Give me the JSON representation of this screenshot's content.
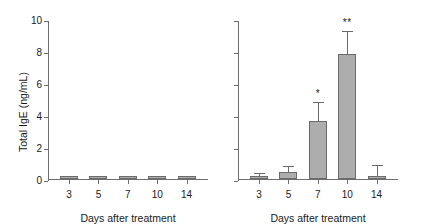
{
  "chart_data": [
    {
      "panel": "left",
      "type": "bar",
      "title": "",
      "xlabel": "Days after treatment",
      "ylabel": "Total IgE (ng/mL)",
      "categories": [
        "3",
        "5",
        "7",
        "10",
        "14"
      ],
      "values": [
        0.15,
        0.15,
        0.15,
        0.15,
        0.15
      ],
      "errors": [
        0,
        0,
        0,
        0,
        0
      ],
      "significance": [
        "",
        "",
        "",
        "",
        ""
      ],
      "ylim": [
        0,
        10
      ],
      "yticks": [
        "0",
        "2",
        "4",
        "6",
        "8",
        "10"
      ],
      "ytick_values": [
        0,
        2,
        4,
        6,
        8,
        10
      ],
      "grid": false,
      "legend": "none",
      "bar_color": "#adadad",
      "bar_edge_color": "#6b6b6b",
      "axis_color": "#6e6e6e"
    },
    {
      "panel": "right",
      "type": "bar",
      "title": "",
      "xlabel": "Days after treatment",
      "ylabel": "",
      "categories": [
        "3",
        "5",
        "7",
        "10",
        "14"
      ],
      "values": [
        0.2,
        0.45,
        3.65,
        7.8,
        0.2
      ],
      "errors": [
        0.15,
        0.35,
        1.15,
        1.45,
        0.7
      ],
      "significance": [
        "",
        "",
        "*",
        "**",
        ""
      ],
      "ylim": [
        0,
        10
      ],
      "yticks": [
        "",
        "",
        "",
        "",
        "",
        ""
      ],
      "ytick_values": [
        0,
        2,
        4,
        6,
        8,
        10
      ],
      "grid": false,
      "legend": "none",
      "bar_color": "#adadad",
      "bar_edge_color": "#6b6b6b",
      "axis_color": "#6e6e6e"
    }
  ]
}
